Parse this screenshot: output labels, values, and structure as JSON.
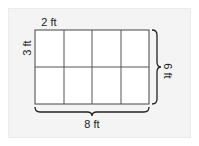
{
  "diagram": {
    "type": "rectangle-grid",
    "rows": 2,
    "columns": 4,
    "labels": {
      "cell_width": "2 ft",
      "cell_height": "3 ft",
      "total_height": "6 ft",
      "total_width": "8 ft"
    },
    "colors": {
      "panel_background": "#f4f4f4",
      "grid_fill": "#ffffff",
      "grid_line": "#444444",
      "text": "#222222"
    }
  }
}
